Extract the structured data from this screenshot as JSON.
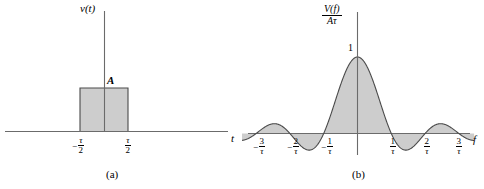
{
  "figure": {
    "background": "#ffffff",
    "fill_color": "#cdcdcd",
    "stroke_color": "#4a4a4a",
    "axis_color": "#6b6b6b"
  },
  "panel_a": {
    "caption": "(a)",
    "y_axis_label": "v(t)",
    "x_axis_label": "t",
    "amplitude_label": "A",
    "ticks": [
      {
        "minus": "−",
        "num": "τ",
        "den": "2"
      },
      {
        "minus": "",
        "num": "τ",
        "den": "2"
      }
    ],
    "chart_data": {
      "type": "area",
      "title": "Rectangular pulse v(t)",
      "xlabel": "t",
      "ylabel": "v(t)",
      "x": [
        -3.0,
        -0.5,
        -0.5,
        0.5,
        0.5,
        3.0
      ],
      "values": [
        0,
        0,
        1,
        1,
        0,
        0
      ],
      "annotations": [
        "A",
        "-τ/2",
        "τ/2"
      ],
      "xlim": [
        -3.0,
        3.0
      ],
      "ylim": [
        0,
        1.35
      ],
      "grid": false,
      "legend": "none"
    }
  },
  "panel_b": {
    "caption": "(b)",
    "y_axis_numerator": "V(f)",
    "y_axis_denominator": "Aτ",
    "x_axis_label": "f",
    "peak_label": "1",
    "ticks": [
      {
        "minus": "−",
        "num": "3",
        "den": "τ"
      },
      {
        "minus": "−",
        "num": "2",
        "den": "τ"
      },
      {
        "minus": "−",
        "num": "1",
        "den": "τ"
      },
      {
        "minus": "",
        "num": "1",
        "den": "τ"
      },
      {
        "minus": "",
        "num": "2",
        "den": "τ"
      },
      {
        "minus": "",
        "num": "3",
        "den": "τ"
      }
    ],
    "chart_data": {
      "type": "line",
      "title": "Normalized spectrum V(f)/Aτ = sinc(fτ)",
      "xlabel": "f",
      "ylabel": "V(f)/Aτ",
      "function": "sinc(x) = sin(pi*x)/(pi*x)",
      "xlim": [
        -3.45,
        3.45
      ],
      "ylim": [
        -0.25,
        1.05
      ],
      "zero_crossings": [
        -3,
        -2,
        -1,
        1,
        2,
        3
      ],
      "peak_value": 1,
      "peak_x": 0,
      "side_lobe_extrema": [
        {
          "x": -2.46,
          "y": 0.128
        },
        {
          "x": -1.43,
          "y": -0.217
        },
        {
          "x": 1.43,
          "y": -0.217
        },
        {
          "x": 2.46,
          "y": 0.128
        }
      ],
      "x": [
        -3.4,
        -3.2,
        -3.0,
        -2.8,
        -2.6,
        -2.4,
        -2.2,
        -2.0,
        -1.8,
        -1.6,
        -1.4,
        -1.2,
        -1.0,
        -0.8,
        -0.6,
        -0.4,
        -0.2,
        0.0,
        0.2,
        0.4,
        0.6,
        0.8,
        1.0,
        1.2,
        1.4,
        1.6,
        1.8,
        2.0,
        2.2,
        2.4,
        2.6,
        2.8,
        3.0,
        3.2,
        3.4
      ],
      "values": [
        -0.089,
        -0.0465,
        0.0,
        0.0421,
        0.0737,
        0.0899,
        0.087,
        0.0,
        -0.1039,
        -0.1892,
        -0.2162,
        -0.1557,
        0.0,
        0.2339,
        0.5046,
        0.7568,
        0.9355,
        1.0,
        0.9355,
        0.7568,
        0.5046,
        0.2339,
        0.0,
        -0.1557,
        -0.2162,
        -0.1892,
        -0.1039,
        0.0,
        0.087,
        0.0899,
        0.0737,
        0.0421,
        0.0,
        -0.0465,
        -0.089
      ],
      "grid": false,
      "legend": "none"
    }
  }
}
